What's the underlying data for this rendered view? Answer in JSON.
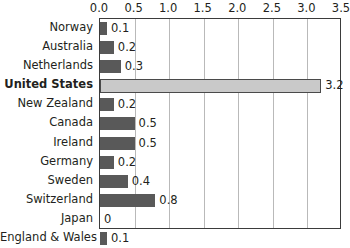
{
  "chart_data": {
    "type": "bar",
    "orientation": "horizontal",
    "title": "",
    "xlabel": "",
    "ylabel": "",
    "xlim": [
      0.0,
      3.5
    ],
    "grid": true,
    "legend": "none",
    "highlight_category": "United States",
    "colors": {
      "bar": "#595959",
      "highlight_bar": "#c9c9c9",
      "highlight_border": "#4a4a4a",
      "gridline": "#b9b9b9",
      "frame": "#3b3b3b",
      "text": "#231f20"
    },
    "xticks": [
      "0.0",
      "0.5",
      "1.0",
      "1.5",
      "2.0",
      "2.5",
      "3.0",
      "3.5"
    ],
    "xtick_values": [
      0.0,
      0.5,
      1.0,
      1.5,
      2.0,
      2.5,
      3.0,
      3.5
    ],
    "categories": [
      "Norway",
      "Australia",
      "Netherlands",
      "United States",
      "New Zealand",
      "Canada",
      "Ireland",
      "Germany",
      "Sweden",
      "Switzerland",
      "Japan",
      "England & Wales"
    ],
    "values": [
      0.1,
      0.2,
      0.3,
      3.2,
      0.2,
      0.5,
      0.5,
      0.2,
      0.4,
      0.8,
      0,
      0.1
    ],
    "value_labels": [
      "0.1",
      "0.2",
      "0.3",
      "3.2",
      "0.2",
      "0.5",
      "0.5",
      "0.2",
      "0.4",
      "0.8",
      "0",
      "0.1"
    ]
  }
}
